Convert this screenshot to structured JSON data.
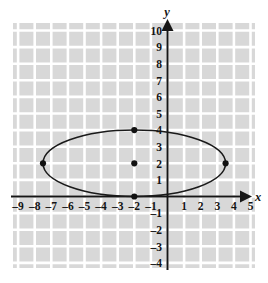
{
  "chart_data": {
    "type": "scatter",
    "title": "",
    "subtitle": "",
    "xlabel": "x",
    "ylabel": "y",
    "xlim": [
      -9.8,
      5.8
    ],
    "ylim": [
      -4.6,
      10.6
    ],
    "grid": true,
    "grid_step": 1,
    "legend": "none",
    "x_ticks": [
      -9,
      -8,
      -7,
      -6,
      -5,
      -4,
      -3,
      -2,
      -1,
      1,
      2,
      3,
      4,
      5
    ],
    "x_tick_labels": [
      "–9",
      "–8",
      "–7",
      "–6",
      "–5",
      "–4",
      "–3",
      "–2",
      "–1",
      "1",
      "2",
      "3",
      "4",
      "5"
    ],
    "y_ticks": [
      10,
      9,
      8,
      7,
      6,
      5,
      4,
      3,
      2,
      1,
      -1,
      -2,
      -3,
      -4
    ],
    "y_tick_labels": [
      "10",
      "9",
      "8",
      "7",
      "6",
      "5",
      "4",
      "3",
      "2",
      "1",
      "–1",
      "–2",
      "–3",
      "–4"
    ],
    "series": [
      {
        "name": "ellipse",
        "type": "ellipse",
        "center": [
          -2,
          2
        ],
        "semi_major_x": 5.5,
        "semi_minor_y": 2,
        "stroke": "#1a1a1a"
      },
      {
        "name": "marked-points",
        "type": "scatter",
        "points": [
          {
            "label": "center",
            "x": -2,
            "y": 2
          },
          {
            "label": "left-vertex",
            "x": -7.5,
            "y": 2
          },
          {
            "label": "right-vertex",
            "x": 3.5,
            "y": 2
          },
          {
            "label": "top-covertex",
            "x": -2,
            "y": 4
          },
          {
            "label": "bottom-covertex",
            "x": -2,
            "y": 0
          }
        ],
        "marker": "filled-circle",
        "color": "#111111"
      }
    ],
    "colors": {
      "grid_cell": "#d8d8d8",
      "grid_line": "#ffffff",
      "axis": "#161616",
      "curve": "#1a1a1a",
      "point": "#111111",
      "text": "#141414",
      "background": "#ffffff"
    }
  },
  "axes": {
    "x_axis_label": "x",
    "y_axis_label": "y"
  }
}
